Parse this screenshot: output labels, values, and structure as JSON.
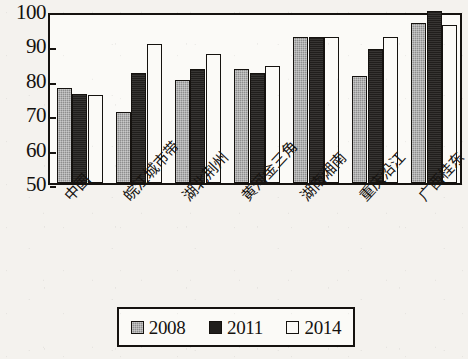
{
  "chart_data": {
    "type": "bar",
    "title": "",
    "subtitle": "",
    "xlabel": "",
    "ylabel": "",
    "ylim": [
      50,
      100
    ],
    "ytick_labels": [
      "100",
      "90",
      "80",
      "70",
      "60",
      "50"
    ],
    "ytick_values": [
      100,
      90,
      80,
      70,
      60,
      50
    ],
    "grid": false,
    "legend_position": "bottom",
    "categories": [
      "中国",
      "皖江城市带",
      "湖北荆州",
      "黄河金三角",
      "湖南湘南",
      "重庆沿江",
      "广西桂东"
    ],
    "series": [
      {
        "name": "2008",
        "color": "#8e8e8e",
        "values": [
          77.5,
          70.5,
          80.0,
          83.0,
          92.5,
          81.0,
          96.5
        ]
      },
      {
        "name": "2011",
        "color": "#201e1c",
        "values": [
          76.0,
          82.0,
          83.0,
          82.0,
          92.5,
          89.0,
          100.0
        ]
      },
      {
        "name": "2014",
        "color": "#fbfaf7",
        "values": [
          75.5,
          90.5,
          87.5,
          84.0,
          92.5,
          92.5,
          96.0
        ]
      }
    ]
  },
  "legend": {
    "entries": [
      {
        "label": "2008",
        "swatch": "s2008"
      },
      {
        "label": "2011",
        "swatch": "s2011"
      },
      {
        "label": "2014",
        "swatch": "s2014"
      }
    ]
  },
  "colors": {
    "ink": "#15120f",
    "paper": "#f4f2ee",
    "plot_background": "#fbfaf7",
    "series_2008": "#8e8e8e",
    "series_2011": "#201e1c",
    "series_2014": "#fbfaf7"
  }
}
